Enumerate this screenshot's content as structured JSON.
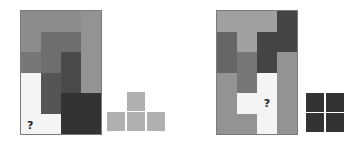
{
  "puzzles": [
    {
      "id": "left",
      "grid": {
        "x": 20,
        "y": 10,
        "cols": 4,
        "rows": 6,
        "cells": [
          [
            "#8c8c8c",
            "#8c8c8c",
            "#8c8c8c",
            "#939393"
          ],
          [
            "#8c8c8c",
            "#6e6e6e",
            "#6e6e6e",
            "#939393"
          ],
          [
            "#777777",
            "#6e6e6e",
            "#4a4a4a",
            "#939393"
          ],
          [
            "#f4f4f4",
            "#555555",
            "#4a4a4a",
            "#939393"
          ],
          [
            "#f4f4f4",
            "#555555",
            "#333333",
            "#333333"
          ],
          [
            "#f4f4f4",
            "#f4f4f4",
            "#333333",
            "#333333"
          ]
        ],
        "question_cell": {
          "row": 5,
          "col": 0,
          "label": "?"
        }
      },
      "piece": {
        "name": "T-tetromino",
        "color": "#b0b0b0",
        "cells": [
          {
            "x": 127,
            "y": 92
          },
          {
            "x": 107,
            "y": 112
          },
          {
            "x": 127,
            "y": 112
          },
          {
            "x": 147,
            "y": 112
          }
        ]
      }
    },
    {
      "id": "right",
      "grid": {
        "x": 216,
        "y": 10,
        "cols": 4,
        "rows": 6,
        "cells": [
          [
            "#a0a0a0",
            "#a0a0a0",
            "#a0a0a0",
            "#444444"
          ],
          [
            "#666666",
            "#a0a0a0",
            "#444444",
            "#444444"
          ],
          [
            "#666666",
            "#777777",
            "#444444",
            "#939393"
          ],
          [
            "#939393",
            "#777777",
            "#f4f4f4",
            "#939393"
          ],
          [
            "#939393",
            "#f4f4f4",
            "#f4f4f4",
            "#939393"
          ],
          [
            "#939393",
            "#939393",
            "#f4f4f4",
            "#939393"
          ]
        ],
        "question_cell": {
          "row": 4,
          "col": 2,
          "label": "?"
        }
      },
      "piece": {
        "name": "O-tetromino",
        "color": "#333333",
        "cells": [
          {
            "x": 306,
            "y": 93
          },
          {
            "x": 326,
            "y": 93
          },
          {
            "x": 306,
            "y": 113
          },
          {
            "x": 326,
            "y": 113
          }
        ]
      }
    }
  ]
}
